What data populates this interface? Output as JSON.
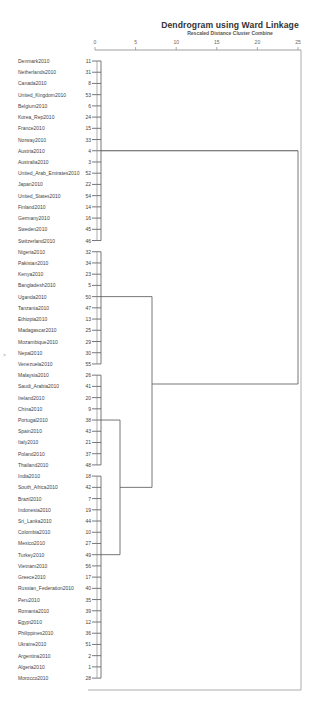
{
  "chart_data": {
    "type": "dendrogram",
    "title": "Dendrogram using Ward Linkage",
    "subtitle": "Rescaled Distance Cluster Combine",
    "xlabel": "Rescaled Distance Cluster Combine",
    "xticks": [
      0,
      5,
      10,
      15,
      20,
      25
    ],
    "xlim": [
      0,
      25
    ],
    "grid": false,
    "leaves": [
      {
        "label": "Denmark2010",
        "id": 11
      },
      {
        "label": "Netherlands2010",
        "id": 31
      },
      {
        "label": "Canada2010",
        "id": 8
      },
      {
        "label": "United_Kingdom2010",
        "id": 53
      },
      {
        "label": "Belgium2010",
        "id": 6
      },
      {
        "label": "Korea_Rep2010",
        "id": 24
      },
      {
        "label": "France2010",
        "id": 15
      },
      {
        "label": "Norway2010",
        "id": 33
      },
      {
        "label": "Austria2010",
        "id": 4
      },
      {
        "label": "Australia2010",
        "id": 3
      },
      {
        "label": "United_Arab_Emirates2010",
        "id": 52
      },
      {
        "label": "Japan2010",
        "id": 22
      },
      {
        "label": "United_States2010",
        "id": 54
      },
      {
        "label": "Finland2010",
        "id": 14
      },
      {
        "label": "Germany2010",
        "id": 16
      },
      {
        "label": "Sweden2010",
        "id": 45
      },
      {
        "label": "Switzerland2010",
        "id": 46
      },
      {
        "label": "Nigeria2010",
        "id": 32
      },
      {
        "label": "Pakistan2010",
        "id": 34
      },
      {
        "label": "Kenya2010",
        "id": 23
      },
      {
        "label": "Bangladesh2010",
        "id": 5
      },
      {
        "label": "Uganda2010",
        "id": 50
      },
      {
        "label": "Tanzania2010",
        "id": 47
      },
      {
        "label": "Ethiopia2010",
        "id": 13
      },
      {
        "label": "Madagascar2010",
        "id": 25
      },
      {
        "label": "Mozambique2010",
        "id": 29
      },
      {
        "label": "Nepal2010",
        "id": 30
      },
      {
        "label": "Venezuela2010",
        "id": 55
      },
      {
        "label": "Malaysia2010",
        "id": 26
      },
      {
        "label": "Saudi_Arabia2010",
        "id": 41
      },
      {
        "label": "Ireland2010",
        "id": 20
      },
      {
        "label": "China2010",
        "id": 9
      },
      {
        "label": "Portugal2010",
        "id": 38
      },
      {
        "label": "Spain2010",
        "id": 43
      },
      {
        "label": "Italy2010",
        "id": 21
      },
      {
        "label": "Poland2010",
        "id": 37
      },
      {
        "label": "Thailand2010",
        "id": 48
      },
      {
        "label": "India2010",
        "id": 18
      },
      {
        "label": "South_Africa2010",
        "id": 42
      },
      {
        "label": "Brazil2010",
        "id": 7
      },
      {
        "label": "Indonesia2010",
        "id": 19
      },
      {
        "label": "Sri_Lanka2010",
        "id": 44
      },
      {
        "label": "Colombia2010",
        "id": 10
      },
      {
        "label": "Mexico2010",
        "id": 27
      },
      {
        "label": "Turkey2010",
        "id": 49
      },
      {
        "label": "Vietnam2010",
        "id": 56
      },
      {
        "label": "Greece2010",
        "id": 17
      },
      {
        "label": "Russian_Federation2010",
        "id": 40
      },
      {
        "label": "Peru2010",
        "id": 35
      },
      {
        "label": "Romania2010",
        "id": 39
      },
      {
        "label": "Egypt2010",
        "id": 12
      },
      {
        "label": "Philippines2010",
        "id": 36
      },
      {
        "label": "Ukraine2010",
        "id": 51
      },
      {
        "label": "Argentina2010",
        "id": 2
      },
      {
        "label": "Algeria2010",
        "id": 1
      },
      {
        "label": "Morocco2010",
        "id": 28
      }
    ],
    "merges_approx": [
      {
        "cluster": "Developed (Denmark..Switzerland)",
        "distance": 0.5
      },
      {
        "cluster": "Low income (Nigeria..Venezuela)",
        "distance": 0.5
      },
      {
        "cluster": "Malaysia..Thailand",
        "distance": 0.5
      },
      {
        "cluster": "India..Morocco",
        "distance": 0.5
      },
      {
        "cluster": "Malaysia..Thailand + India..Morocco",
        "distance": 2.5
      },
      {
        "cluster": "Low income + emerging",
        "distance": 6.5
      },
      {
        "cluster": "All",
        "distance": 25
      }
    ]
  }
}
